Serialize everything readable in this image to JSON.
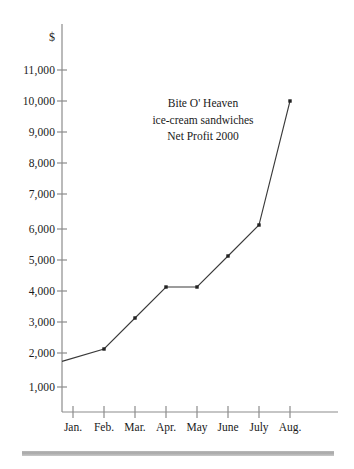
{
  "chart_data": {
    "type": "line",
    "title": "Bite O' Heaven ice-cream sandwiches Net Profit 2000",
    "title_lines": [
      "Bite O' Heaven",
      "ice-cream sandwiches",
      "Net Profit 2000"
    ],
    "xlabel": "",
    "ylabel": "$",
    "categories": [
      "Jan.",
      "Feb.",
      "Mar.",
      "Apr.",
      "May",
      "June",
      "July",
      "Aug."
    ],
    "values": [
      1600,
      2000,
      3000,
      4000,
      4000,
      5000,
      6000,
      10000
    ],
    "series": [
      {
        "name": "Net Profit 2000",
        "values": [
          1600,
          2000,
          3000,
          4000,
          4000,
          5000,
          6000,
          10000
        ]
      }
    ],
    "ylim": [
      0,
      11500
    ],
    "ytick_values": [
      1000,
      2000,
      3000,
      4000,
      5000,
      6000,
      7000,
      8000,
      9000,
      10000,
      11000
    ],
    "ytick_labels": [
      "1,000",
      "2,000",
      "3,000",
      "4,000",
      "5,000",
      "6,000",
      "7,000",
      "8,000",
      "9,000",
      "10,000",
      "11,000"
    ],
    "xtick_labels": [
      "Jan.",
      "Feb.",
      "Mar.",
      "Apr.",
      "May",
      "June",
      "July",
      "Aug."
    ],
    "grid": false,
    "legend": false,
    "legend_position": "none",
    "markers": "square-dot",
    "line_color": "#3a3a3a",
    "axis_color": "#8c8c8c",
    "text_color": "#1a1a1a",
    "background_color": "#ffffff",
    "annotations": []
  },
  "footer": {
    "rule_color": "#b0b0b0"
  }
}
